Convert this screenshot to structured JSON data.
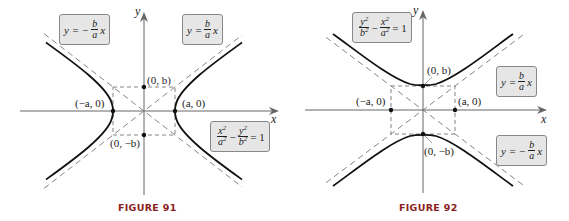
{
  "figures": [
    {
      "id": "figure-91",
      "caption": "FIGURE 91",
      "orientation": "horizontal transverse axis",
      "axes": {
        "x_label": "x",
        "y_label": "y"
      },
      "equation": {
        "lhs_a_num": "x",
        "lhs_a_den": "a",
        "lhs_b_num": "y",
        "lhs_b_den": "b",
        "exp": "2",
        "minus": "−",
        "rhs": "= 1"
      },
      "asymptote_pos": {
        "y": "y =",
        "num": "b",
        "den": "a",
        "x": "x"
      },
      "asymptote_neg": {
        "y": "y = −",
        "num": "b",
        "den": "a",
        "x": "x"
      },
      "points": {
        "vertex_left": "(−a, 0)",
        "vertex_right": "(a, 0)",
        "co_vertex_top": "(0, b)",
        "co_vertex_bottom": "(0, −b)"
      }
    },
    {
      "id": "figure-92",
      "caption": "FIGURE 92",
      "orientation": "vertical transverse axis",
      "axes": {
        "x_label": "x",
        "y_label": "y"
      },
      "equation": {
        "lhs_a_num": "y",
        "lhs_a_den": "b",
        "lhs_b_num": "x",
        "lhs_b_den": "a",
        "exp": "2",
        "minus": "−",
        "rhs": "= 1"
      },
      "asymptote_pos": {
        "y": "y =",
        "num": "b",
        "den": "a",
        "x": "x"
      },
      "asymptote_neg": {
        "y": "y = −",
        "num": "b",
        "den": "a",
        "x": "x"
      },
      "points": {
        "vertex_top": "(0, b)",
        "vertex_bottom": "(0, −b)",
        "co_vertex_left": "(−a, 0)",
        "co_vertex_right": "(a, 0)"
      }
    }
  ],
  "colors": {
    "curve": "#111111",
    "axes": "#666666",
    "dashed": "#777777",
    "box_fill": "#e6e6e6",
    "caption": "#8a1e1e"
  }
}
